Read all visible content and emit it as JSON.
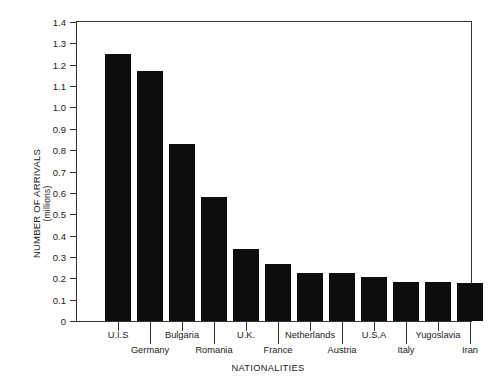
{
  "chart_data": {
    "type": "bar",
    "title": "",
    "xlabel": "NATIONALITIES",
    "ylabel": "NUMBER OF ARRIVALS",
    "ylabel_units": "(millions)",
    "categories": [
      "U.I.S",
      "Germany",
      "Bulgaria",
      "Romania",
      "U.K.",
      "France",
      "Netherlands",
      "Austria",
      "U.S.A",
      "Italy",
      "Yugoslavia",
      "Iran"
    ],
    "values": [
      1.25,
      1.17,
      0.83,
      0.58,
      0.335,
      0.265,
      0.227,
      0.225,
      0.207,
      0.181,
      0.183,
      0.179
    ],
    "ylim": [
      0,
      1.4
    ],
    "ytick_labels": [
      "1.4",
      "1.3",
      "1.2",
      "1.1",
      "1.0",
      "0.9",
      "0.8",
      "0.7",
      "0.6",
      "0.5",
      "0.4",
      "0.3",
      "0.2",
      "0.1",
      "0"
    ],
    "ytick_values": [
      1.4,
      1.3,
      1.2,
      1.1,
      1.0,
      0.9,
      0.8,
      0.7,
      0.6,
      0.5,
      0.4,
      0.3,
      0.2,
      0.1,
      0
    ],
    "grid": false,
    "legend": null,
    "bar_color": "#0d0d0d",
    "axis_color": "#333333",
    "background_color": "#ffffff",
    "label_rows": [
      0,
      1,
      0,
      1,
      0,
      1,
      0,
      1,
      0,
      1,
      0,
      1
    ]
  }
}
